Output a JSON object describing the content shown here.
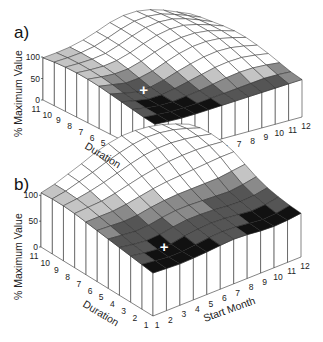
{
  "figure": {
    "panels": [
      {
        "label": "a)",
        "zlabel": "% Maximum Value",
        "ylabel": "Duration",
        "xlabel": ""
      },
      {
        "label": "b)",
        "zlabel": "% Maximum Value",
        "ylabel": "Duration",
        "xlabel": "Start Month"
      }
    ],
    "z_ticks": [
      "0",
      "50",
      "100"
    ],
    "duration_ticks": [
      "11",
      "10",
      "9",
      "8",
      "7",
      "6",
      "5",
      "4",
      "3",
      "2",
      "1"
    ],
    "month_ticks": [
      "1",
      "2",
      "3",
      "4",
      "5",
      "6",
      "7",
      "8",
      "9",
      "10",
      "11",
      "12"
    ],
    "marker": "+"
  },
  "chart_data": [
    {
      "type": "surface3d",
      "title": "a)",
      "xlabel": "Start Month",
      "ylabel": "Duration",
      "zlabel": "% Maximum Value",
      "x": [
        1,
        2,
        3,
        4,
        5,
        6,
        7,
        8,
        9,
        10,
        11,
        12
      ],
      "y": [
        1,
        2,
        3,
        4,
        5,
        6,
        7,
        8,
        9,
        10,
        11
      ],
      "zlim": [
        0,
        100
      ],
      "z_ticks": [
        0,
        50,
        100
      ],
      "minimum_marker": {
        "month": 3,
        "duration": 5,
        "symbol": "+"
      },
      "z": [
        [
          8,
          6,
          5,
          6,
          8,
          10,
          12,
          14,
          16,
          18,
          20,
          22
        ],
        [
          12,
          9,
          7,
          8,
          10,
          14,
          18,
          22,
          26,
          30,
          30,
          28
        ],
        [
          18,
          12,
          8,
          9,
          14,
          20,
          28,
          36,
          42,
          44,
          42,
          38
        ],
        [
          24,
          16,
          10,
          12,
          20,
          30,
          40,
          50,
          56,
          58,
          54,
          48
        ],
        [
          30,
          22,
          14,
          18,
          28,
          42,
          54,
          64,
          70,
          70,
          64,
          56
        ],
        [
          36,
          30,
          24,
          28,
          38,
          54,
          68,
          78,
          82,
          80,
          72,
          62
        ],
        [
          40,
          36,
          34,
          38,
          50,
          66,
          80,
          88,
          90,
          86,
          76,
          64
        ],
        [
          42,
          40,
          40,
          46,
          58,
          74,
          88,
          96,
          96,
          88,
          76,
          62
        ],
        [
          42,
          42,
          44,
          50,
          64,
          80,
          94,
          100,
          98,
          88,
          74,
          58
        ],
        [
          40,
          42,
          46,
          54,
          68,
          84,
          96,
          100,
          96,
          84,
          70,
          54
        ],
        [
          36,
          40,
          46,
          56,
          70,
          86,
          96,
          98,
          92,
          80,
          64,
          48
        ]
      ]
    },
    {
      "type": "surface3d",
      "title": "b)",
      "xlabel": "Start Month",
      "ylabel": "Duration",
      "zlabel": "% Maximum Value",
      "x": [
        1,
        2,
        3,
        4,
        5,
        6,
        7,
        8,
        9,
        10,
        11,
        12
      ],
      "y": [
        1,
        2,
        3,
        4,
        5,
        6,
        7,
        8,
        9,
        10,
        11
      ],
      "zlim": [
        0,
        100
      ],
      "z_ticks": [
        0,
        50,
        100
      ],
      "minimum_marker": {
        "month": 3,
        "duration": 3,
        "symbol": "+"
      },
      "z": [
        [
          10,
          8,
          6,
          7,
          9,
          12,
          14,
          12,
          8,
          6,
          8,
          12
        ],
        [
          14,
          10,
          6,
          6,
          10,
          14,
          16,
          14,
          10,
          6,
          8,
          14
        ],
        [
          18,
          12,
          8,
          8,
          14,
          18,
          20,
          18,
          14,
          10,
          12,
          18
        ],
        [
          22,
          16,
          12,
          14,
          20,
          24,
          24,
          22,
          18,
          16,
          18,
          24
        ],
        [
          26,
          22,
          18,
          20,
          26,
          30,
          30,
          28,
          26,
          24,
          28,
          34
        ],
        [
          30,
          28,
          26,
          28,
          34,
          38,
          40,
          40,
          40,
          40,
          44,
          48
        ],
        [
          34,
          34,
          34,
          38,
          44,
          50,
          54,
          56,
          58,
          60,
          62,
          62
        ],
        [
          38,
          40,
          42,
          48,
          56,
          64,
          70,
          74,
          76,
          76,
          74,
          70
        ],
        [
          40,
          44,
          50,
          58,
          68,
          78,
          86,
          90,
          90,
          86,
          80,
          72
        ],
        [
          40,
          46,
          56,
          66,
          78,
          88,
          96,
          100,
          98,
          92,
          82,
          70
        ],
        [
          38,
          46,
          58,
          70,
          84,
          94,
          100,
          100,
          96,
          88,
          76,
          62
        ]
      ]
    }
  ]
}
